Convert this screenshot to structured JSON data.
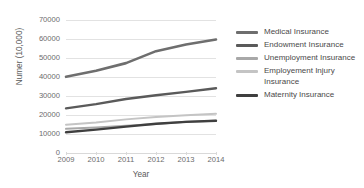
{
  "chart_data": {
    "type": "line",
    "title": "",
    "xlabel": "Year",
    "ylabel": "Numer (10,000)",
    "categories": [
      "2009",
      "2010",
      "2011",
      "2012",
      "2013",
      "2014"
    ],
    "ylim": [
      0,
      70000
    ],
    "ytick_labels": [
      "0",
      "10000",
      "20000",
      "30000",
      "40000",
      "50000",
      "60000",
      "70000"
    ],
    "ytick_values": [
      0,
      10000,
      20000,
      30000,
      40000,
      50000,
      60000,
      70000
    ],
    "grid": true,
    "legend_position": "right",
    "series": [
      {
        "name": "Medical Insurance",
        "color": "#6e6e6e",
        "width": 2.6,
        "values": [
          40100,
          43300,
          47300,
          53600,
          57100,
          59700
        ]
      },
      {
        "name": "Endowment Insurance",
        "color": "#5a5a5a",
        "width": 2.4,
        "values": [
          23500,
          25700,
          28400,
          30400,
          32200,
          34100
        ]
      },
      {
        "name": "Unemployment Insurance",
        "color": "#a8a8a8",
        "width": 2.0,
        "values": [
          12700,
          13400,
          14300,
          15200,
          16400,
          17000
        ]
      },
      {
        "name": "Employement Injury Insurance",
        "color": "#c4c4c4",
        "width": 2.0,
        "values": [
          14900,
          16100,
          17700,
          19000,
          19900,
          20600
        ]
      },
      {
        "name": "Maternity Insurance",
        "color": "#3f3f3f",
        "width": 2.4,
        "values": [
          10900,
          12300,
          13900,
          15400,
          16400,
          17000
        ]
      }
    ]
  }
}
